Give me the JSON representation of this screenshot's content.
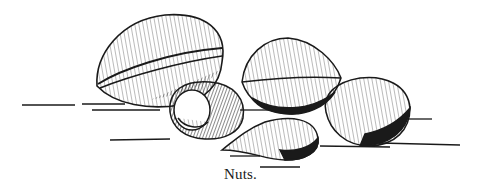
{
  "figure": {
    "caption": "Nuts.",
    "ink_color": "#1a1a1a",
    "paper_color": "#ffffff",
    "items": [
      {
        "name": "walnut",
        "position": "top-left, largest"
      },
      {
        "name": "hazelnut",
        "position": "center, front of walnut"
      },
      {
        "name": "hickory-nut",
        "position": "center-right, upper"
      },
      {
        "name": "pecan-or-brazil-like nut",
        "position": "right"
      },
      {
        "name": "almond",
        "position": "bottom center"
      }
    ]
  }
}
